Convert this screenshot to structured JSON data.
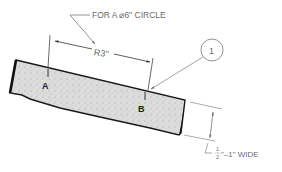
{
  "diagram": {
    "callout_text": "FOR A ⌀6\" CIRCLE",
    "radius_label": "R3\"",
    "point_a": "A",
    "point_b": "B",
    "balloon_number": "1",
    "width_fraction_num": "1",
    "width_fraction_den": "2",
    "width_label_suffix": "\"–1\" WIDE",
    "colors": {
      "strip_fill": "#dedede",
      "strip_outline": "#1a1a1a",
      "annotation_line": "#7a7a7a",
      "text": "#6a6a6a"
    }
  }
}
